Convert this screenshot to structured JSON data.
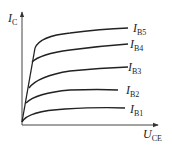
{
  "diagram": {
    "y_axis": {
      "symbol": "I",
      "subscript": "C"
    },
    "x_axis": {
      "symbol": "U",
      "subscript": "CE"
    },
    "curves": [
      {
        "symbol": "I",
        "subscript": "B5"
      },
      {
        "symbol": "I",
        "subscript": "B4"
      },
      {
        "symbol": "I",
        "subscript": "B3"
      },
      {
        "symbol": "I",
        "subscript": "B2"
      },
      {
        "symbol": "I",
        "subscript": "B1"
      }
    ],
    "colors": {
      "line": "#222222",
      "axis": "#444444",
      "background": "#ffffff"
    }
  }
}
